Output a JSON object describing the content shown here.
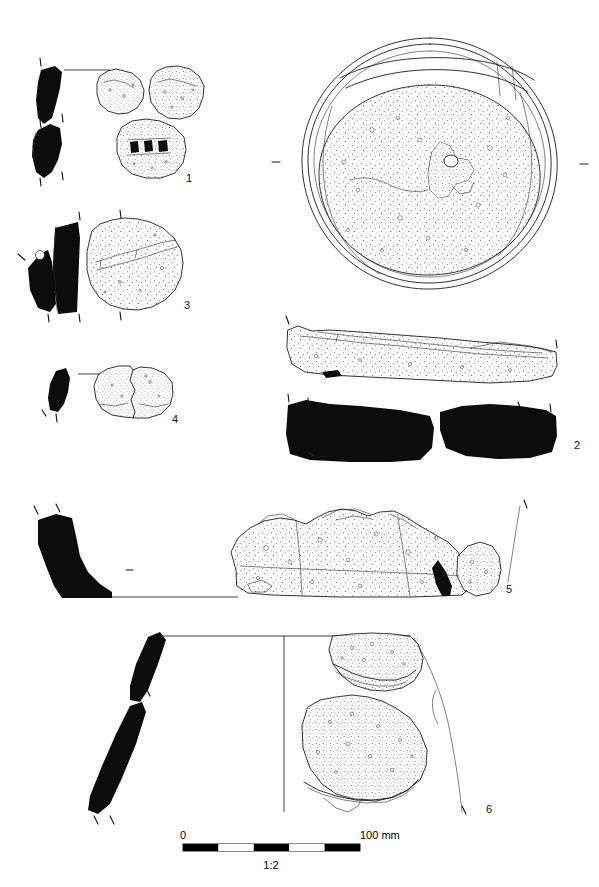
{
  "plate": {
    "title": "Stone artefact illustration plate",
    "background_color": "#ffffff",
    "ink_color": "#0c0c0c",
    "outline_color": "#1a1a1a",
    "width_px": 599,
    "height_px": 887
  },
  "figures": [
    {
      "id": "fig-1",
      "number": "1",
      "label_x": 186,
      "label_y": 182,
      "description": "Three small stone fragments with stippled surfaces and two solid black section profiles at left",
      "views": [
        "section-profile-upper",
        "section-profile-lower",
        "fragment-left",
        "fragment-right",
        "fragment-perforated"
      ]
    },
    {
      "id": "fig-2",
      "number": "2",
      "label_x": 578,
      "label_y": 449,
      "description": "Large circular rotary quern upper stone in plan view with stippled grinding surface and central perforation, plus side elevation and two solid black section profiles",
      "views": [
        "plan",
        "side-elevation",
        "section-left",
        "section-right"
      ]
    },
    {
      "id": "fig-3",
      "number": "3",
      "label_x": 186,
      "label_y": 309,
      "description": "Stone fragment with stippled surface and solid black section profile at left",
      "views": [
        "section-profile",
        "fragment"
      ]
    },
    {
      "id": "fig-4",
      "number": "4",
      "label_x": 173,
      "label_y": 423,
      "description": "Small elongate stone with narrow solid black section profile and a two-part stippled fragment",
      "views": [
        "section-profile",
        "fragment"
      ]
    },
    {
      "id": "fig-5",
      "number": "5",
      "label_x": 510,
      "label_y": 593,
      "description": "Large stone artefact with solid black section profile at left sitting on a base line, and a broad stippled elevation drawing",
      "views": [
        "section-profile",
        "elevation"
      ]
    },
    {
      "id": "fig-6",
      "number": "6",
      "label_x": 490,
      "label_y": 813,
      "description": "Large vessel or stone bowl with curved solid black wall section, central vertical axis line, and two stippled fragments",
      "views": [
        "section-profile",
        "axis",
        "fragment-upper",
        "fragment-lower"
      ]
    }
  ],
  "scale_bar": {
    "zero_label": "0",
    "max_label": "100 mm",
    "ratio_label": "1:2",
    "segments": 5,
    "x_start": 183,
    "x_end": 360,
    "y": 845,
    "bar_height": 6,
    "fill_dark": "#000000",
    "fill_light": "#ffffff"
  }
}
